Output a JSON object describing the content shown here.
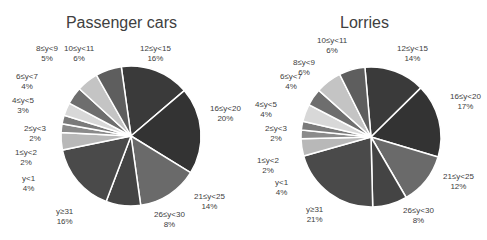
{
  "chart_data": [
    {
      "type": "pie",
      "title": "Passenger cars",
      "categories": [
        "12≤y<15",
        "16≤y<20",
        "21≤y<25",
        "26≤y<30",
        "y≥31",
        "y<1",
        "1≤y<2",
        "2≤y<3",
        "4≤y<5",
        "6≤y<7",
        "8≤y<9",
        "10≤y<11"
      ],
      "labels": [
        "12≤y<15",
        "16≤y<20",
        "21≤y<25",
        "26≤y<30",
        "y≥31",
        "y<1",
        "1≤y<2",
        "2≤y<3",
        "4≤y<5",
        "6≤y<7",
        "8≤y<9",
        "10≤y<11"
      ],
      "values": [
        16,
        20,
        14,
        8,
        16,
        4,
        2,
        2,
        3,
        4,
        5,
        6
      ],
      "value_labels": [
        "16%",
        "20%",
        "14%",
        "8%",
        "16%",
        "4%",
        "2%",
        "2%",
        "3%",
        "4%",
        "5%",
        "6%"
      ],
      "colors": [
        "#3a3a3a",
        "#333333",
        "#6a6a6a",
        "#444444",
        "#4a4a4a",
        "#b8b8b8",
        "#8a8a8a",
        "#7a7a7a",
        "#d8d8d8",
        "#6e6e6e",
        "#c4c4c4",
        "#5e5e5e"
      ],
      "legend": "none (data labels with leader lines)"
    },
    {
      "type": "pie",
      "title": "Lorries",
      "categories": [
        "12≤y<15",
        "16≤y<20",
        "21≤y<25",
        "26≤y<30",
        "y≥31",
        "y<1",
        "1≤y<2",
        "2≤y<3",
        "4≤y<5",
        "6≤y<7",
        "8≤y<9",
        "10≤y<11"
      ],
      "labels": [
        "12≤y<15",
        "16≤y<20",
        "21≤y<25",
        "26≤y<30",
        "y≥31",
        "y<1",
        "1≤y<2",
        "2≤y<3",
        "4≤y<5",
        "6≤y<7",
        "8≤y<9",
        "10≤y<11"
      ],
      "values": [
        14,
        17,
        12,
        8,
        21,
        4,
        2,
        2,
        4,
        4,
        6,
        6
      ],
      "value_labels": [
        "14%",
        "17%",
        "12%",
        "8%",
        "21%",
        "4%",
        "2%",
        "2%",
        "4%",
        "4%",
        "6%",
        "6%"
      ],
      "colors": [
        "#3a3a3a",
        "#333333",
        "#6a6a6a",
        "#444444",
        "#4a4a4a",
        "#b8b8b8",
        "#8a8a8a",
        "#7a7a7a",
        "#d8d8d8",
        "#6e6e6e",
        "#c4c4c4",
        "#5e5e5e"
      ],
      "legend": "none (data labels with leader lines)"
    }
  ],
  "charts": {
    "left": {
      "title": "Passenger cars",
      "labels": [
        {
          "name": "12≤y<15",
          "pct": "16%"
        },
        {
          "name": "16≤y<20",
          "pct": "20%"
        },
        {
          "name": "21≤y<25",
          "pct": "14%"
        },
        {
          "name": "26≤y<30",
          "pct": "8%"
        },
        {
          "name": "y≥31",
          "pct": "16%"
        },
        {
          "name": "y<1",
          "pct": "4%"
        },
        {
          "name": "1≤y<2",
          "pct": "2%"
        },
        {
          "name": "2≤y<3",
          "pct": "2%"
        },
        {
          "name": "4≤y<5",
          "pct": "3%"
        },
        {
          "name": "6≤y<7",
          "pct": "4%"
        },
        {
          "name": "8≤y<9",
          "pct": "5%"
        },
        {
          "name": "10≤y<11",
          "pct": "6%"
        }
      ]
    },
    "right": {
      "title": "Lorries",
      "labels": [
        {
          "name": "12≤y<15",
          "pct": "14%"
        },
        {
          "name": "16≤y<20",
          "pct": "17%"
        },
        {
          "name": "21≤y<25",
          "pct": "12%"
        },
        {
          "name": "26≤y<30",
          "pct": "8%"
        },
        {
          "name": "y≥31",
          "pct": "21%"
        },
        {
          "name": "y<1",
          "pct": "4%"
        },
        {
          "name": "1≤y<2",
          "pct": "2%"
        },
        {
          "name": "2≤y<3",
          "pct": "2%"
        },
        {
          "name": "4≤y<5",
          "pct": "4%"
        },
        {
          "name": "6≤y<7",
          "pct": "4%"
        },
        {
          "name": "8≤y<9",
          "pct": "6%"
        },
        {
          "name": "10≤y<11",
          "pct": "6%"
        }
      ]
    }
  }
}
